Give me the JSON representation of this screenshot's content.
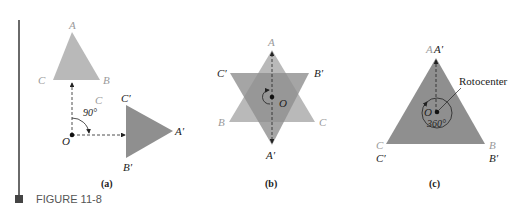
{
  "figure": {
    "caption": "FIGURE 11-8",
    "accent_bar_color": "#6a6a6a",
    "fill_light": "#b9b9b9",
    "fill_dark": "#8f8f8f"
  },
  "panel_a": {
    "caption": "(a)",
    "original": {
      "A": "A",
      "B": "B",
      "C": "C"
    },
    "image": {
      "A": "A′",
      "B": "B′",
      "C": "C′"
    },
    "center": "O",
    "stray_label": "C",
    "angle": "90°"
  },
  "panel_b": {
    "caption": "(b)",
    "original": {
      "A": "A",
      "B": "B",
      "C": "C"
    },
    "image": {
      "A": "A′",
      "B": "B′",
      "C": "C′"
    },
    "center": "O"
  },
  "panel_c": {
    "caption": "(c)",
    "original": {
      "A": "A",
      "B": "B",
      "C": "C"
    },
    "image": {
      "A": "A′",
      "B": "B′",
      "C": "C′"
    },
    "center": "O",
    "angle": "360°",
    "callout": "Rotocenter"
  }
}
